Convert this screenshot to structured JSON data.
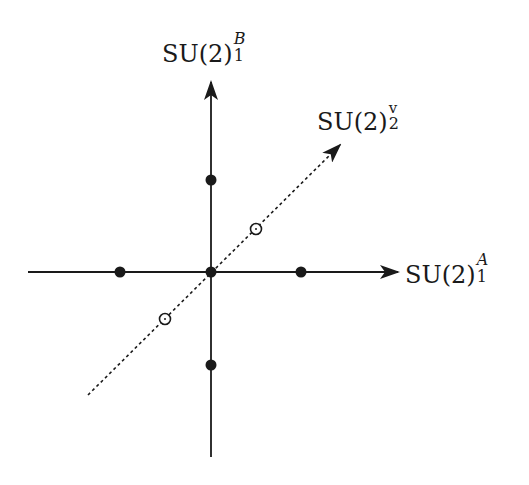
{
  "diagram": {
    "colors": {
      "ink": "#1a1a1a",
      "background": "#ffffff"
    },
    "axes": {
      "horizontal": {
        "label_base": "SU(2)",
        "label_sup": "A",
        "label_sub": "1",
        "from": [
          28,
          272
        ],
        "to": [
          398,
          272
        ]
      },
      "vertical": {
        "label_base": "SU(2)",
        "label_sup": "B",
        "label_sub": "1",
        "from": [
          211,
          457
        ],
        "to": [
          211,
          82
        ]
      },
      "diagonal": {
        "label_base": "SU(2)",
        "label_sup": "v",
        "label_sub": "2",
        "style": "dashed",
        "from": [
          88,
          395
        ],
        "to": [
          340,
          145
        ]
      }
    },
    "filled_points": [
      {
        "name": "origin",
        "x": 211,
        "y": 272
      },
      {
        "name": "top",
        "x": 211,
        "y": 180
      },
      {
        "name": "bottom",
        "x": 211,
        "y": 365
      },
      {
        "name": "left",
        "x": 120,
        "y": 272
      },
      {
        "name": "right",
        "x": 301,
        "y": 272
      }
    ],
    "open_points": [
      {
        "name": "diag-upper",
        "x": 256,
        "y": 229
      },
      {
        "name": "diag-lower",
        "x": 165,
        "y": 319
      }
    ]
  }
}
